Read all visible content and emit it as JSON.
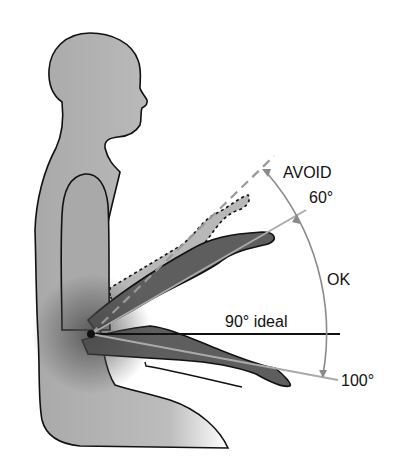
{
  "diagram": {
    "labels": {
      "avoid": "AVOID",
      "angle_60": "60°",
      "ok": "OK",
      "ideal": "90° ideal",
      "angle_100": "100°"
    },
    "colors": {
      "body_fill": "#a9a9a9",
      "arm_fill": "#5e5e5e",
      "avoid_arm_fill": "#b5b5b5",
      "outline": "#111111",
      "guide_line": "#9a9a9a",
      "background": "#ffffff"
    }
  }
}
